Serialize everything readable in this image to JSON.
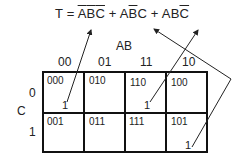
{
  "equation": {
    "lhs": "T",
    "eq": "=",
    "terms": [
      {
        "parts": [
          {
            "t": "A",
            "bar": true
          },
          {
            "t": "B",
            "bar": true
          },
          {
            "t": "C",
            "bar": true
          }
        ]
      },
      {
        "parts": [
          {
            "t": "A",
            "bar": false
          },
          {
            "t": "B",
            "bar": true
          },
          {
            "t": "C",
            "bar": false
          }
        ]
      },
      {
        "parts": [
          {
            "t": "A",
            "bar": false
          },
          {
            "t": "B",
            "bar": false
          },
          {
            "t": "C",
            "bar": true
          }
        ]
      }
    ],
    "plus": "+"
  },
  "kmap": {
    "col_var": "AB",
    "row_var": "C",
    "col_labels": [
      "00",
      "01",
      "11",
      "10"
    ],
    "row_labels": [
      "0",
      "1"
    ],
    "cells": [
      [
        {
          "code": "000",
          "value": "1"
        },
        {
          "code": "010",
          "value": ""
        },
        {
          "code": "110",
          "value": "1"
        },
        {
          "code": "100",
          "value": ""
        }
      ],
      [
        {
          "code": "001",
          "value": ""
        },
        {
          "code": "011",
          "value": ""
        },
        {
          "code": "111",
          "value": ""
        },
        {
          "code": "101",
          "value": "1"
        }
      ]
    ]
  }
}
